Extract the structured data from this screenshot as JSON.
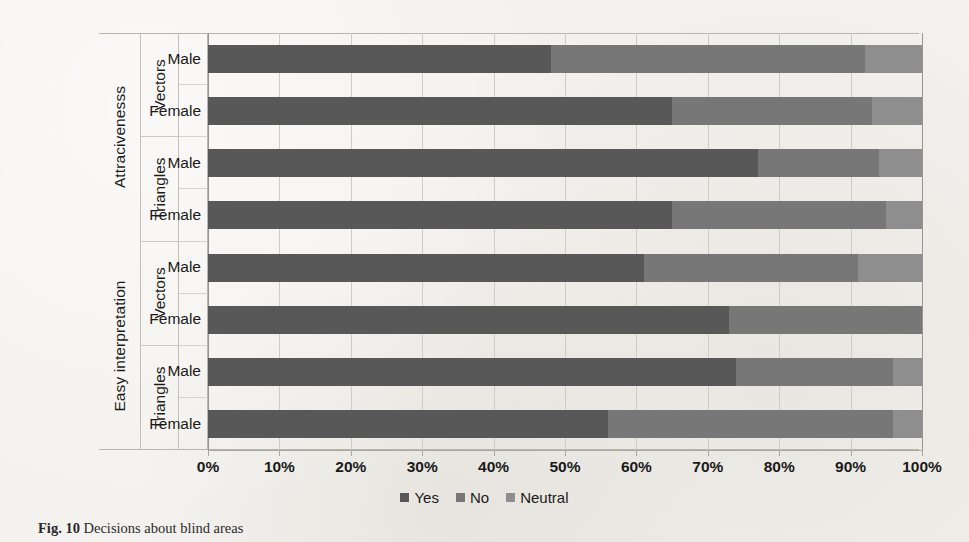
{
  "figure": {
    "caption_label": "Fig. 10",
    "caption_text": "Decisions about blind areas"
  },
  "legend": {
    "position": "bottom-center",
    "items": [
      {
        "label": "Yes",
        "color": "#585858"
      },
      {
        "label": "No",
        "color": "#777777"
      },
      {
        "label": "Neutral",
        "color": "#8e8e8e"
      }
    ]
  },
  "axis": {
    "x_ticks": [
      "0%",
      "10%",
      "20%",
      "30%",
      "40%",
      "50%",
      "60%",
      "70%",
      "80%",
      "90%",
      "100%"
    ],
    "x_min": 0,
    "x_max": 100
  },
  "categories": [
    {
      "name": "Attracivenesss",
      "groups": [
        {
          "name": "Vectors",
          "rows": [
            "Male",
            "Female"
          ]
        },
        {
          "name": "Triangles",
          "rows": [
            "Male",
            "Female"
          ]
        }
      ]
    },
    {
      "name": "Easy interpretation",
      "groups": [
        {
          "name": "Vectors",
          "rows": [
            "Male",
            "Female"
          ]
        },
        {
          "name": "Triangles",
          "rows": [
            "Male",
            "Female"
          ]
        }
      ]
    }
  ],
  "chart_data": {
    "type": "bar",
    "orientation": "horizontal",
    "stacked": true,
    "normalized_percent": true,
    "title": "",
    "xlabel": "",
    "ylabel": "",
    "xlim": [
      0,
      100
    ],
    "grid": true,
    "legend_position": "bottom-center",
    "series": [
      {
        "name": "Yes",
        "color": "#585858",
        "values": [
          48,
          65,
          77,
          65,
          61,
          73,
          74,
          56
        ]
      },
      {
        "name": "No",
        "color": "#777777",
        "values": [
          44,
          28,
          17,
          30,
          30,
          27,
          22,
          40
        ]
      },
      {
        "name": "Neutral",
        "color": "#8e8e8e",
        "values": [
          8,
          7,
          6,
          5,
          9,
          0,
          4,
          4
        ]
      }
    ],
    "categories": [
      "Attracivenesss / Vectors / Male",
      "Attracivenesss / Vectors / Female",
      "Attracivenesss / Triangles / Male",
      "Attracivenesss / Triangles / Female",
      "Easy interpretation / Vectors / Male",
      "Easy interpretation / Vectors / Female",
      "Easy interpretation / Triangles / Male",
      "Easy interpretation / Triangles / Female"
    ]
  }
}
